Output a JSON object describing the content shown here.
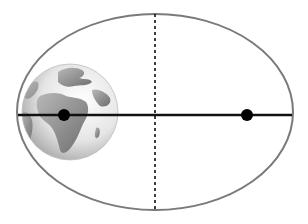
{
  "diagram": {
    "title": "",
    "type": "elliptical-orbit",
    "ellipse": {
      "cx": 155,
      "cy": 112,
      "rx": 138,
      "ry": 98,
      "stroke": "#7a7a7a",
      "stroke_width": 2
    },
    "major_axis": {
      "x1": 18,
      "y1": 115,
      "x2": 292,
      "y2": 115,
      "stroke": "#111111",
      "stroke_width": 2.5
    },
    "minor_axis": {
      "x1": 155,
      "y1": 14,
      "x2": 155,
      "y2": 210,
      "stroke": "#111111",
      "dash": "3,3"
    },
    "foci": [
      {
        "name": "focus-earth",
        "cx": 64,
        "cy": 115,
        "r": 6,
        "fill": "#000000"
      },
      {
        "name": "focus-empty",
        "cx": 247,
        "cy": 115,
        "r": 6,
        "fill": "#000000"
      }
    ],
    "earth": {
      "cx": 70,
      "cy": 112,
      "r": 48,
      "ocean_light": "#f4f4f4",
      "ocean_dark": "#9a9a9a",
      "land": "#8a8a8a"
    }
  }
}
